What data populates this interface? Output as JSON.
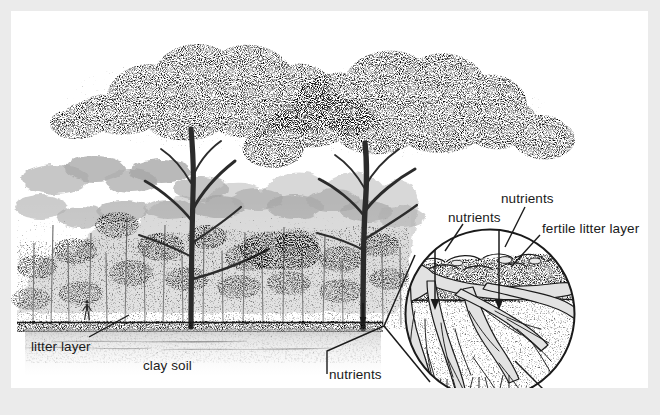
{
  "figure": {
    "kind": "scientific-illustration",
    "medium": "pen-and-ink stipple drawing",
    "frame_color": "#ebebeb",
    "plate_color": "#ffffff",
    "ink_color": "#1a1a1a"
  },
  "scene": {
    "name": "tropical-rainforest-cross-section",
    "description": "Side view of a tropical rainforest with two tall emergent trees above a dense closed canopy, a thin dark litter layer at the ground line, and pale stippled clay soil beneath.",
    "elements": [
      "emergent-tree-left",
      "emergent-tree-right",
      "canopy-mass",
      "understory-trees",
      "human-figure-for-scale",
      "ground-line",
      "litter-layer-band",
      "clay-soil-stipple"
    ]
  },
  "labels": {
    "litter_layer": "litter layer",
    "clay_soil": "clay soil",
    "nutrients_main": "nutrients",
    "nutrients_left": "nutrients",
    "nutrients_top": "nutrients",
    "fertile_litter_layer": "fertile litter layer",
    "sterile_clay_layer": "sterile clay layer"
  },
  "detail_circle": {
    "name": "magnified-root-zone",
    "center": [
      479,
      303
    ],
    "radius": 85,
    "description": "Circular magnified inset of the root zone showing a root plate spreading laterally through the dark fertile litter layer and fine roots penetrating the pale stippled sterile clay below.",
    "layers": [
      {
        "name": "fertile-litter-layer",
        "tone": "dark stipple"
      },
      {
        "name": "sterile-clay-layer",
        "tone": "pale sparse stipple"
      }
    ],
    "arrows": [
      {
        "name": "nutrient-arrow-left",
        "direction": "down"
      },
      {
        "name": "nutrient-arrow-right",
        "direction": "down"
      }
    ]
  },
  "callouts": [
    {
      "name": "litter-layer-callout",
      "from": [
        78,
        327
      ],
      "to": [
        118,
        304
      ]
    },
    {
      "name": "nutrients-main-callout",
      "from": [
        316,
        360
      ],
      "to": [
        373,
        315
      ]
    },
    {
      "name": "nutrients-left-callout",
      "from": [
        452,
        212
      ],
      "to": [
        424,
        296
      ]
    },
    {
      "name": "nutrients-top-callout",
      "from": [
        512,
        195
      ],
      "to": [
        488,
        296
      ]
    },
    {
      "name": "fertile-litter-callout",
      "from": [
        530,
        222
      ],
      "to": [
        500,
        257
      ]
    },
    {
      "name": "sterile-clay-callout",
      "from": [
        533,
        378
      ],
      "to": [
        500,
        348
      ]
    }
  ],
  "magnifier_cone": {
    "name": "magnifier-cone",
    "apex": [
      373,
      315
    ],
    "description": "Two straight lines fanning from the forest-floor point out to the tangents of the magnified circle."
  }
}
